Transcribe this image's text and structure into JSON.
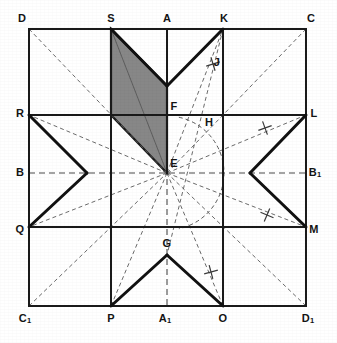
{
  "figure": {
    "background_color": "#ffffff",
    "ink_color": "#1a1a1a",
    "shaded_color": "#878787",
    "construction_color": "#4d4d4d",
    "width": 337,
    "height": 343
  },
  "square": {
    "corners": {
      "D": {
        "x": 29,
        "y": 29
      },
      "C": {
        "x": 306,
        "y": 29
      },
      "C1": {
        "x": 29,
        "y": 306
      },
      "D1": {
        "x": 306,
        "y": 306
      }
    }
  },
  "points": [
    {
      "id": "D",
      "label": "D",
      "sub": "",
      "x": 29,
      "y": 29,
      "lx": 22,
      "ly": 18
    },
    {
      "id": "S",
      "label": "S",
      "sub": "",
      "x": 111,
      "y": 29,
      "lx": 111,
      "ly": 18
    },
    {
      "id": "A",
      "label": "A",
      "sub": "",
      "x": 167,
      "y": 29,
      "lx": 167,
      "ly": 18
    },
    {
      "id": "K",
      "label": "K",
      "sub": "",
      "x": 223,
      "y": 29,
      "lx": 224,
      "ly": 18
    },
    {
      "id": "C",
      "label": "C",
      "sub": "",
      "x": 306,
      "y": 29,
      "lx": 311,
      "ly": 18
    },
    {
      "id": "R",
      "label": "R",
      "sub": "",
      "x": 29,
      "y": 115,
      "lx": 20,
      "ly": 113
    },
    {
      "id": "L",
      "label": "L",
      "sub": "",
      "x": 306,
      "y": 115,
      "lx": 314,
      "ly": 113
    },
    {
      "id": "F",
      "label": "F",
      "sub": "",
      "x": 167,
      "y": 115,
      "lx": 174,
      "ly": 106
    },
    {
      "id": "H",
      "label": "H",
      "sub": "",
      "x": 209,
      "y": 115,
      "lx": 209,
      "ly": 122
    },
    {
      "id": "J",
      "label": "J",
      "sub": "",
      "x": 216,
      "y": 62,
      "lx": 217,
      "ly": 62
    },
    {
      "id": "B",
      "label": "B",
      "sub": "",
      "x": 29,
      "y": 173,
      "lx": 20,
      "ly": 172
    },
    {
      "id": "E",
      "label": "E",
      "sub": "",
      "x": 167,
      "y": 173,
      "lx": 174,
      "ly": 163
    },
    {
      "id": "B1",
      "label": "B",
      "sub": "1",
      "x": 306,
      "y": 173,
      "lx": 315,
      "ly": 172
    },
    {
      "id": "Q",
      "label": "Q",
      "sub": "",
      "x": 29,
      "y": 227,
      "lx": 20,
      "ly": 229
    },
    {
      "id": "M",
      "label": "M",
      "sub": "",
      "x": 306,
      "y": 227,
      "lx": 314,
      "ly": 229
    },
    {
      "id": "G",
      "label": "G",
      "sub": "",
      "x": 167,
      "y": 255,
      "lx": 167,
      "ly": 243
    },
    {
      "id": "C1",
      "label": "C",
      "sub": "1",
      "x": 29,
      "y": 306,
      "lx": 25,
      "ly": 318
    },
    {
      "id": "P",
      "label": "P",
      "sub": "",
      "x": 111,
      "y": 306,
      "lx": 111,
      "ly": 318
    },
    {
      "id": "A1",
      "label": "A",
      "sub": "1",
      "x": 167,
      "y": 306,
      "lx": 165,
      "ly": 318
    },
    {
      "id": "O",
      "label": "O",
      "sub": "",
      "x": 223,
      "y": 306,
      "lx": 223,
      "ly": 318
    },
    {
      "id": "D1",
      "label": "D",
      "sub": "1",
      "x": 306,
      "y": 306,
      "lx": 308,
      "ly": 318
    }
  ],
  "star": {
    "description": "Eight-pointed star polygon outline",
    "outline": [
      [
        111,
        29
      ],
      [
        167,
        86
      ],
      [
        223,
        29
      ],
      [
        250,
        173
      ],
      [
        306,
        115
      ],
      [
        250,
        173
      ],
      [
        306,
        227
      ],
      [
        223,
        306
      ],
      [
        167,
        255
      ],
      [
        111,
        306
      ],
      [
        87,
        173
      ],
      [
        29,
        227
      ],
      [
        87,
        173
      ],
      [
        29,
        115
      ]
    ],
    "segments": [
      {
        "name": "S-Ftop",
        "from": [
          111,
          29
        ],
        "to": [
          167,
          86
        ]
      },
      {
        "name": "Ftop-K",
        "from": [
          167,
          86
        ],
        "to": [
          223,
          29
        ]
      },
      {
        "name": "L-inner-right-top",
        "from": [
          306,
          115
        ],
        "to": [
          250,
          173
        ]
      },
      {
        "name": "inner-right-M",
        "from": [
          250,
          173
        ],
        "to": [
          306,
          227
        ]
      },
      {
        "name": "O-G",
        "from": [
          223,
          306
        ],
        "to": [
          167,
          255
        ]
      },
      {
        "name": "G-P",
        "from": [
          167,
          255
        ],
        "to": [
          111,
          306
        ]
      },
      {
        "name": "R-inner-left",
        "from": [
          29,
          115
        ],
        "to": [
          87,
          173
        ]
      },
      {
        "name": "inner-left-Q",
        "from": [
          87,
          173
        ],
        "to": [
          29,
          227
        ]
      }
    ]
  },
  "shaded_region": {
    "name": "shaded-parallelogram",
    "fill": "#878787",
    "vertices": [
      [
        111,
        29
      ],
      [
        167,
        86
      ],
      [
        167,
        173
      ],
      [
        111,
        115
      ]
    ]
  },
  "grid_lines": {
    "solid": [
      {
        "name": "border-top",
        "from": [
          29,
          29
        ],
        "to": [
          306,
          29
        ]
      },
      {
        "name": "border-right",
        "from": [
          306,
          29
        ],
        "to": [
          306,
          306
        ]
      },
      {
        "name": "border-bottom",
        "from": [
          29,
          306
        ],
        "to": [
          306,
          306
        ]
      },
      {
        "name": "border-left",
        "from": [
          29,
          29
        ],
        "to": [
          29,
          306
        ]
      },
      {
        "name": "h-line-R-L",
        "from": [
          29,
          115
        ],
        "to": [
          306,
          115
        ]
      },
      {
        "name": "h-line-Q-M",
        "from": [
          29,
          227
        ],
        "to": [
          306,
          227
        ]
      },
      {
        "name": "v-line-S-P",
        "from": [
          111,
          29
        ],
        "to": [
          111,
          306
        ]
      },
      {
        "name": "v-line-K-O",
        "from": [
          223,
          29
        ],
        "to": [
          223,
          306
        ]
      },
      {
        "name": "v-line-A-F",
        "from": [
          167,
          29
        ],
        "to": [
          167,
          173
        ]
      }
    ],
    "dashed": [
      {
        "name": "axis-vertical-A-A1",
        "from": [
          167,
          29
        ],
        "to": [
          167,
          306
        ]
      },
      {
        "name": "axis-horizontal-B-B1",
        "from": [
          29,
          173
        ],
        "to": [
          306,
          173
        ]
      }
    ]
  },
  "construction_lines": [
    {
      "name": "diagonal-D-E",
      "from": [
        29,
        29
      ],
      "to": [
        167,
        173
      ]
    },
    {
      "name": "diagonal-C-E",
      "from": [
        306,
        29
      ],
      "to": [
        167,
        173
      ]
    },
    {
      "name": "diagonal-C1-E",
      "from": [
        29,
        306
      ],
      "to": [
        167,
        173
      ]
    },
    {
      "name": "diagonal-D1-E",
      "from": [
        306,
        306
      ],
      "to": [
        167,
        173
      ]
    },
    {
      "name": "ray-E-S",
      "from": [
        167,
        173
      ],
      "to": [
        111,
        29
      ]
    },
    {
      "name": "ray-E-K",
      "from": [
        167,
        173
      ],
      "to": [
        223,
        29
      ]
    },
    {
      "name": "ray-E-P",
      "from": [
        167,
        173
      ],
      "to": [
        111,
        306
      ]
    },
    {
      "name": "ray-E-O",
      "from": [
        167,
        173
      ],
      "to": [
        223,
        306
      ]
    },
    {
      "name": "ray-E-R",
      "from": [
        167,
        173
      ],
      "to": [
        29,
        115
      ]
    },
    {
      "name": "ray-E-Q",
      "from": [
        167,
        173
      ],
      "to": [
        29,
        227
      ]
    },
    {
      "name": "ray-E-L",
      "from": [
        167,
        173
      ],
      "to": [
        306,
        115
      ]
    },
    {
      "name": "ray-E-M",
      "from": [
        167,
        173
      ],
      "to": [
        306,
        227
      ]
    },
    {
      "name": "chord-R-L",
      "from": [
        29,
        115
      ],
      "to": [
        306,
        115
      ]
    },
    {
      "name": "chord-Q-M",
      "from": [
        29,
        227
      ],
      "to": [
        306,
        227
      ]
    },
    {
      "name": "bisector-K-G",
      "from": [
        223,
        29
      ],
      "to": [
        167,
        255
      ]
    },
    {
      "name": "bisector-S-E-long",
      "from": [
        111,
        29
      ],
      "to": [
        167,
        173
      ]
    },
    {
      "name": "cross-S-P",
      "from": [
        111,
        29
      ],
      "to": [
        111,
        306
      ]
    }
  ],
  "arc": {
    "name": "compass-arc",
    "center": [
      167,
      173
    ],
    "radius": 57,
    "start_angle_deg": -78,
    "end_angle_deg": 78,
    "note": "quarter-circle arc swept from F through H down toward G"
  },
  "tick_marks": [
    {
      "name": "tick-J",
      "x": 213,
      "y": 64,
      "angle": 28
    },
    {
      "name": "tick-KL",
      "x": 265,
      "y": 128,
      "angle": 25
    },
    {
      "name": "tick-LM",
      "x": 267,
      "y": 215,
      "angle": -22
    },
    {
      "name": "tick-OG",
      "x": 211,
      "y": 272,
      "angle": 30
    }
  ],
  "caption": ""
}
